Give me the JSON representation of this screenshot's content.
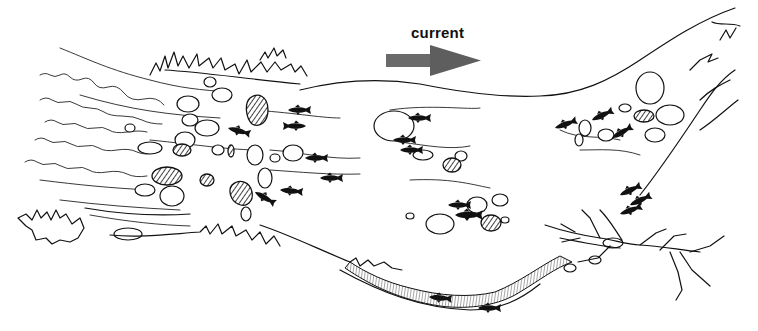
{
  "illustration": {
    "subject": "stream habitat sketch with fish, rocks, riffle and pool",
    "current_label": "current",
    "arrow_direction": "right",
    "arrow_color": "#666666",
    "ink_color": "#111111",
    "background_color": "#ffffff",
    "elements": {
      "fish_count_approx": 24,
      "hatched_boulders": 8,
      "fallen_tree": "lower right bank",
      "undercut_bank": "lower center, hatched",
      "riffle": "left side wavy lines"
    }
  }
}
